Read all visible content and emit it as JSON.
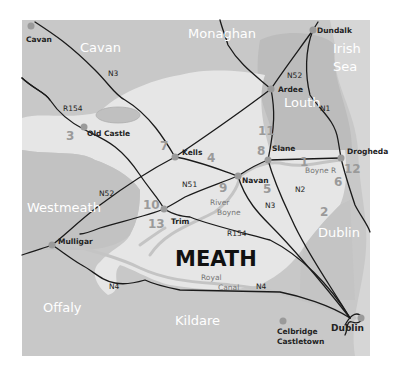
{
  "map": {
    "title": "MEATH",
    "colors": {
      "background": "#ffffff",
      "outer_land": "#c8c8c8",
      "meath_region": "#e6e6e6",
      "louth_region": "#bdbdbd",
      "sea": "#d4d4d4",
      "roads": "#1a1a1a",
      "rivers": "#c4c4c4",
      "town_dot": "#9a9a9a",
      "site_numbers": "#9a9a9a"
    },
    "counties": [
      {
        "name": "Cavan",
        "x": 80,
        "y": 52
      },
      {
        "name": "Monaghan",
        "x": 188,
        "y": 38
      },
      {
        "name": "Irish",
        "x": 333,
        "y": 53
      },
      {
        "name": "Sea",
        "x": 333,
        "y": 71
      },
      {
        "name": "Louth",
        "x": 290,
        "y": 107
      },
      {
        "name": "Westmeath",
        "x": 29,
        "y": 212
      },
      {
        "name": "Dublin",
        "x": 318,
        "y": 237
      },
      {
        "name": "Offaly",
        "x": 43,
        "y": 312
      },
      {
        "name": "Kildare",
        "x": 175,
        "y": 325
      }
    ],
    "towns": [
      {
        "name": "Cavan",
        "dot": [
          31,
          26
        ],
        "x": 26,
        "y": 42
      },
      {
        "name": "Dundalk",
        "dot": [
          313,
          30
        ],
        "x": 317,
        "y": 33
      },
      {
        "name": "Ardee",
        "dot": [
          271,
          89
        ],
        "x": 278,
        "y": 92
      },
      {
        "name": "Old Castle",
        "dot": [
          84,
          127
        ],
        "x": 87,
        "y": 136
      },
      {
        "name": "Kells",
        "dot": [
          175,
          157
        ],
        "x": 182,
        "y": 153
      },
      {
        "name": "Slane",
        "dot": [
          268,
          160
        ],
        "x": 272,
        "y": 151
      },
      {
        "name": "Drogheda",
        "dot": [
          341,
          158
        ],
        "x": 347,
        "y": 154
      },
      {
        "name": "Navan",
        "dot": [
          238,
          176
        ],
        "x": 242,
        "y": 182
      },
      {
        "name": "Trim",
        "dot": [
          164,
          209
        ],
        "x": 171,
        "y": 224
      },
      {
        "name": "Mulligar",
        "dot": [
          52,
          245
        ],
        "x": 58,
        "y": 244
      },
      {
        "name": "Celbridge",
        "dot": [
          283,
          321
        ],
        "x": 277,
        "y": 334
      },
      {
        "name": "Castletown",
        "dot": null,
        "x": 277,
        "y": 344
      },
      {
        "name": "Dublin",
        "dot": [
          361,
          318
        ],
        "x": 331,
        "y": 331
      }
    ],
    "roads": [
      {
        "label": "N3",
        "x": 108,
        "y": 76
      },
      {
        "label": "R154",
        "x": 63,
        "y": 111
      },
      {
        "label": "N52",
        "x": 289,
        "y": 78
      },
      {
        "label": "N1",
        "x": 320,
        "y": 111
      },
      {
        "label": "N51",
        "x": 182,
        "y": 187
      },
      {
        "label": "N52",
        "x": 100,
        "y": 196
      },
      {
        "label": "N2",
        "x": 295,
        "y": 192
      },
      {
        "label": "N3",
        "x": 265,
        "y": 208
      },
      {
        "label": "R154",
        "x": 227,
        "y": 236
      },
      {
        "label": "N4",
        "x": 109,
        "y": 289
      },
      {
        "label": "N4",
        "x": 256,
        "y": 289
      }
    ],
    "waters": [
      {
        "label": "Boyne R",
        "x": 305,
        "y": 173
      },
      {
        "label": "River",
        "x": 210,
        "y": 205
      },
      {
        "label": "Boyne",
        "x": 217,
        "y": 215
      },
      {
        "label": "Royal",
        "x": 201,
        "y": 280
      },
      {
        "label": "Canal",
        "x": 218,
        "y": 290
      }
    ],
    "site_numbers": [
      {
        "n": "1",
        "x": 300,
        "y": 166
      },
      {
        "n": "2",
        "x": 320,
        "y": 216
      },
      {
        "n": "3",
        "x": 66,
        "y": 140
      },
      {
        "n": "4",
        "x": 207,
        "y": 162
      },
      {
        "n": "5",
        "x": 263,
        "y": 193
      },
      {
        "n": "6",
        "x": 334,
        "y": 186
      },
      {
        "n": "7",
        "x": 160,
        "y": 150
      },
      {
        "n": "8",
        "x": 257,
        "y": 155
      },
      {
        "n": "9",
        "x": 219,
        "y": 192
      },
      {
        "n": "10",
        "x": 143,
        "y": 209
      },
      {
        "n": "11",
        "x": 258,
        "y": 135
      },
      {
        "n": "12",
        "x": 344,
        "y": 173
      },
      {
        "n": "13",
        "x": 148,
        "y": 228
      }
    ]
  }
}
